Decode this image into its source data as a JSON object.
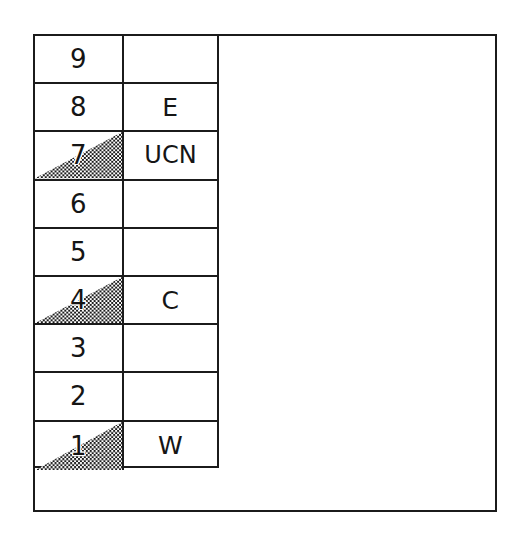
{
  "figure": {
    "kind": "legend-grid-diagram",
    "frame": {
      "border_color": "#1b1b1b",
      "background": "#ffffff"
    }
  },
  "legend_table": {
    "columns": [
      "level",
      "label"
    ],
    "shading_pattern": "50-percent-checkerboard-dither",
    "shading_shape": "right-triangle-hypotenuse-bottom-left-to-top-right",
    "rows": [
      {
        "level": "9",
        "label": "",
        "shaded": false
      },
      {
        "level": "8",
        "label": "E",
        "shaded": false
      },
      {
        "level": "7",
        "label": "UCN",
        "shaded": true
      },
      {
        "level": "6",
        "label": "",
        "shaded": false
      },
      {
        "level": "5",
        "label": "",
        "shaded": false
      },
      {
        "level": "4",
        "label": "C",
        "shaded": true
      },
      {
        "level": "3",
        "label": "",
        "shaded": false
      },
      {
        "level": "2",
        "label": "",
        "shaded": false
      },
      {
        "level": "1",
        "label": "W",
        "shaded": true
      }
    ]
  }
}
